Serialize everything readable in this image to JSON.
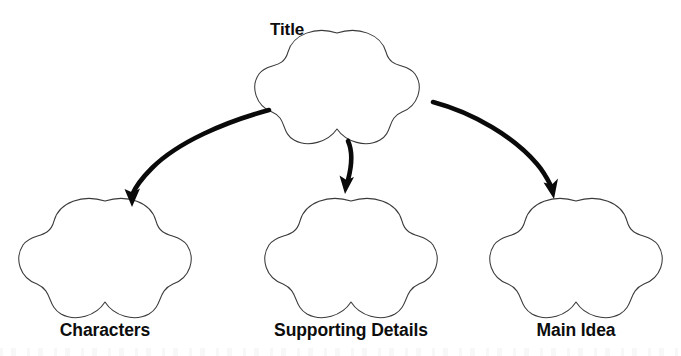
{
  "page": {
    "kind": "graphic-organizer",
    "width": 681,
    "height": 356,
    "background_color": "#ffffff",
    "shape_outline_color": "#3a3a3a",
    "arrow_color": "#0a0a0a",
    "text_color": "#0d0d0d"
  },
  "diagram": {
    "title_node": {
      "label": "Title",
      "shape": "cloud-blob",
      "label_position": "above-left-outside"
    },
    "child_nodes": [
      {
        "label": "Characters",
        "shape": "cloud-blob",
        "label_position": "below"
      },
      {
        "label": "Supporting Details",
        "shape": "cloud-blob",
        "label_position": "below"
      },
      {
        "label": "Main Idea",
        "shape": "cloud-blob",
        "label_position": "below"
      }
    ],
    "connectors": [
      {
        "name": "arrow-to-characters",
        "from": "Title",
        "to": "Characters",
        "style": "curved-arrow",
        "direction": "down-left"
      },
      {
        "name": "arrow-to-supporting-details",
        "from": "Title",
        "to": "Supporting Details",
        "style": "short-arrow",
        "direction": "down"
      },
      {
        "name": "arrow-to-main-idea",
        "from": "Title",
        "to": "Main Idea",
        "style": "curved-arrow",
        "direction": "down-right"
      }
    ]
  }
}
